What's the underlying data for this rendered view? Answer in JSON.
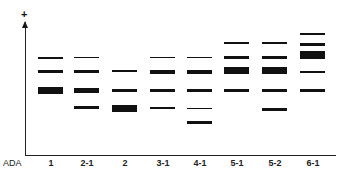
{
  "axis": {
    "polarity_symbol": "+",
    "row_label": "ADA"
  },
  "lanes": [
    {
      "label": "1",
      "x": 38,
      "bands": [
        {
          "y": 57,
          "h": 2
        },
        {
          "y": 70,
          "h": 3
        },
        {
          "y": 87,
          "h": 7
        }
      ]
    },
    {
      "label": "2-1",
      "x": 74,
      "bands": [
        {
          "y": 57,
          "h": 1
        },
        {
          "y": 70,
          "h": 3
        },
        {
          "y": 88,
          "h": 5
        },
        {
          "y": 106,
          "h": 3
        }
      ]
    },
    {
      "label": "2",
      "x": 112,
      "bands": [
        {
          "y": 70,
          "h": 2
        },
        {
          "y": 89,
          "h": 3
        },
        {
          "y": 105,
          "h": 7
        }
      ]
    },
    {
      "label": "3-1",
      "x": 150,
      "bands": [
        {
          "y": 57,
          "h": 1
        },
        {
          "y": 70,
          "h": 4
        },
        {
          "y": 89,
          "h": 3
        },
        {
          "y": 107,
          "h": 2
        }
      ]
    },
    {
      "label": "4-1",
      "x": 187,
      "bands": [
        {
          "y": 57,
          "h": 1
        },
        {
          "y": 70,
          "h": 4
        },
        {
          "y": 89,
          "h": 3
        },
        {
          "y": 108,
          "h": 1
        },
        {
          "y": 121,
          "h": 3
        }
      ]
    },
    {
      "label": "5-1",
      "x": 224,
      "bands": [
        {
          "y": 42,
          "h": 2
        },
        {
          "y": 56,
          "h": 3
        },
        {
          "y": 67,
          "h": 7
        },
        {
          "y": 89,
          "h": 3
        }
      ]
    },
    {
      "label": "5-2",
      "x": 262,
      "bands": [
        {
          "y": 42,
          "h": 2
        },
        {
          "y": 56,
          "h": 3
        },
        {
          "y": 67,
          "h": 7
        },
        {
          "y": 89,
          "h": 3
        },
        {
          "y": 108,
          "h": 3
        }
      ]
    },
    {
      "label": "6-1",
      "x": 300,
      "bands": [
        {
          "y": 33,
          "h": 2
        },
        {
          "y": 43,
          "h": 3
        },
        {
          "y": 51,
          "h": 8
        },
        {
          "y": 71,
          "h": 2
        },
        {
          "y": 89,
          "h": 3
        }
      ]
    }
  ]
}
